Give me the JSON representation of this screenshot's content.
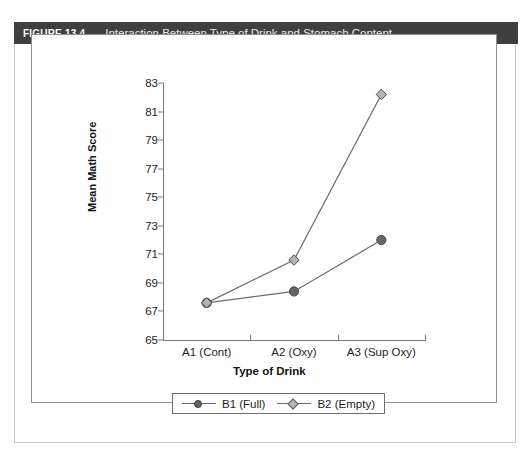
{
  "figure": {
    "number": "FIGURE 13.4",
    "caption": "Interaction Between Type of Drink and Stomach Content"
  },
  "chart_data": {
    "type": "line",
    "title": "Interaction Between Type of Drink and Stomach Content",
    "xlabel": "Type of Drink",
    "ylabel": "Mean Math Score",
    "categories": [
      "A1 (Cont)",
      "A2 (Oxy)",
      "A3 (Sup Oxy)"
    ],
    "yticks": [
      65,
      67,
      69,
      71,
      73,
      75,
      77,
      79,
      81,
      83
    ],
    "ylim": [
      65,
      83
    ],
    "grid": false,
    "legend_position": "bottom",
    "series": [
      {
        "name": "B1 (Full)",
        "marker": "circle",
        "color": "#656565",
        "values": [
          67.6,
          68.4,
          72.0
        ]
      },
      {
        "name": "B2 (Empty)",
        "marker": "diamond",
        "color": "#b4b4b4",
        "values": [
          67.6,
          70.6,
          82.2
        ]
      }
    ]
  },
  "legend": {
    "entries": [
      {
        "label": "B1 (Full)"
      },
      {
        "label": "B2 (Empty)"
      }
    ]
  }
}
